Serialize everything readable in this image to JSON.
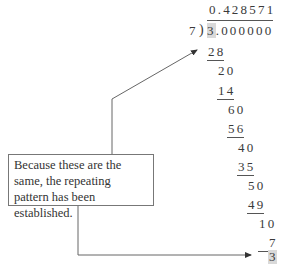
{
  "division": {
    "quotient": "0.428571",
    "divisor": "7",
    "dividend_first": "3",
    "dividend_rest": ".000000",
    "steps": [
      {
        "value": "28",
        "underlined": true
      },
      {
        "value": "20",
        "underlined": false
      },
      {
        "value": "14",
        "underlined": true
      },
      {
        "value": "60",
        "underlined": false
      },
      {
        "value": "56",
        "underlined": true
      },
      {
        "value": "40",
        "underlined": false
      },
      {
        "value": "35",
        "underlined": true
      },
      {
        "value": "50",
        "underlined": false
      },
      {
        "value": "49",
        "underlined": true
      },
      {
        "value": "10",
        "underlined": false
      },
      {
        "value": "7",
        "underlined": true
      },
      {
        "value": "3",
        "underlined": false,
        "highlighted": true
      }
    ]
  },
  "callout": {
    "text": "Because these are the same, the repeating pattern has been established."
  },
  "colors": {
    "highlight": "#d9d9d9",
    "line": "#555555"
  }
}
